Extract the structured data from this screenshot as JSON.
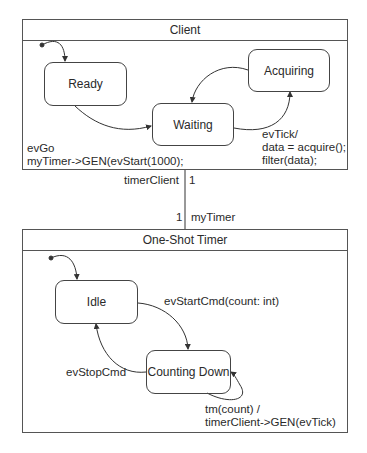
{
  "client": {
    "title": "Client",
    "states": {
      "ready": "Ready",
      "waiting": "Waiting",
      "acquiring": "Acquiring"
    },
    "transitions": {
      "go_line1": "evGo",
      "go_line2": "myTimer->GEN(evStart(1000);",
      "tick_line1": "evTick/",
      "tick_line2": "data = acquire();",
      "tick_line3": "filter(data);"
    }
  },
  "association": {
    "client_role": "timerClient",
    "client_multiplicity": "1",
    "timer_role": "myTimer",
    "timer_multiplicity": "1"
  },
  "timer": {
    "title": "One-Shot Timer",
    "states": {
      "idle": "Idle",
      "counting_down": "Counting Down"
    },
    "transitions": {
      "start_cmd": "evStartCmd(count: int)",
      "stop_cmd": "evStopCmd",
      "tm_line1": "tm(count) /",
      "tm_line2": "timerClient->GEN(evTick)"
    }
  }
}
